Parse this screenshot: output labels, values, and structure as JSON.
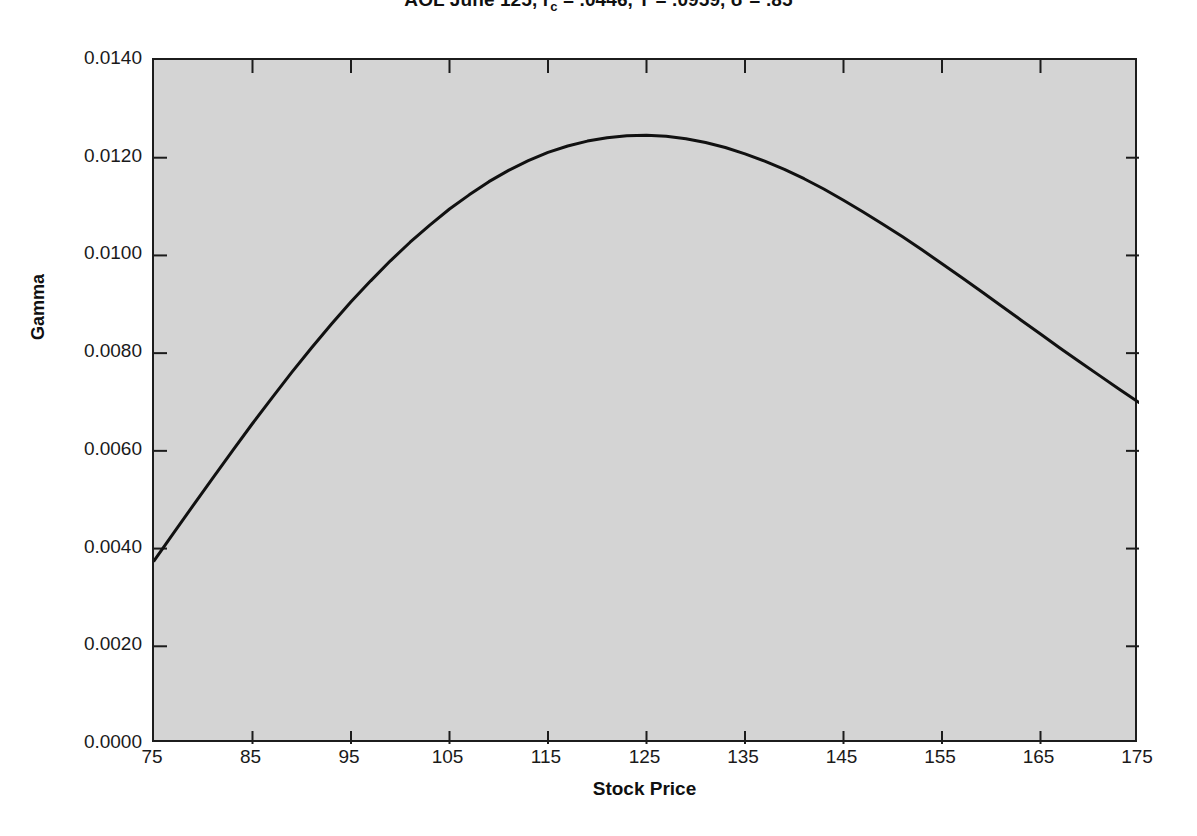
{
  "chart_data": {
    "type": "line",
    "title": "AOL June 125, rc = .0446, T = .0959, σ = .85",
    "title_parts": {
      "instrument": "AOL June 125",
      "rate_label": "r",
      "rate_sub": "c",
      "rate_value": ".0446",
      "time_label": "T",
      "time_value": ".0959",
      "vol_label": "σ",
      "vol_value": ".85"
    },
    "xlabel": "Stock Price",
    "ylabel": "Gamma",
    "xlim": [
      75,
      175
    ],
    "ylim": [
      0.0,
      0.014
    ],
    "grid": false,
    "legend": null,
    "xticks": [
      75,
      85,
      95,
      105,
      115,
      125,
      135,
      145,
      155,
      165,
      175
    ],
    "xtick_labels": [
      "75",
      "85",
      "95",
      "105",
      "115",
      "125",
      "135",
      "145",
      "155",
      "165",
      "175"
    ],
    "yticks": [
      0.0,
      0.002,
      0.004,
      0.006,
      0.008,
      0.01,
      0.012,
      0.014
    ],
    "ytick_labels": [
      "0.0000",
      "0.0020",
      "0.0040",
      "0.0060",
      "0.0080",
      "0.0100",
      "0.0120",
      "0.0140"
    ],
    "line_color": "#111111",
    "line_width": 3,
    "plot_background": "#d4d4d4",
    "page_background": "#ffffff",
    "series": [
      {
        "name": "Gamma",
        "x": [
          75,
          77,
          79,
          81,
          83,
          85,
          87,
          89,
          91,
          93,
          95,
          97,
          99,
          101,
          103,
          105,
          107,
          109,
          111,
          113,
          115,
          117,
          119,
          121,
          123,
          125,
          127,
          129,
          131,
          133,
          135,
          137,
          139,
          141,
          143,
          145,
          147,
          149,
          151,
          153,
          155,
          157,
          159,
          161,
          163,
          165,
          167,
          169,
          171,
          173,
          175
        ],
        "y": [
          0.00375,
          0.00432,
          0.00489,
          0.00545,
          0.00601,
          0.00656,
          0.00709,
          0.00761,
          0.00811,
          0.00859,
          0.00905,
          0.00948,
          0.00989,
          0.01027,
          0.01062,
          0.01095,
          0.01124,
          0.01151,
          0.01174,
          0.01194,
          0.01211,
          0.01224,
          0.01234,
          0.01241,
          0.01245,
          0.01246,
          0.01244,
          0.01239,
          0.01231,
          0.01221,
          0.01208,
          0.01193,
          0.01176,
          0.01157,
          0.01136,
          0.01113,
          0.01089,
          0.01064,
          0.01038,
          0.01011,
          0.00983,
          0.00955,
          0.00926,
          0.00897,
          0.00868,
          0.00839,
          0.0081,
          0.00782,
          0.00754,
          0.00726,
          0.00699
        ]
      }
    ],
    "annotations": {
      "peak_x": 112,
      "peak_y": 0.0133,
      "left_endpoint_y": 0.0037,
      "right_endpoint_y": 0.003
    }
  }
}
